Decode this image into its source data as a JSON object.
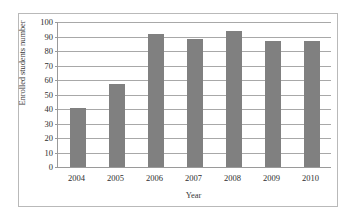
{
  "chart_data": {
    "type": "bar",
    "title": "",
    "subtitle": "",
    "xlabel": "Year",
    "ylabel": "Enrolled students number",
    "categories": [
      "2004",
      "2005",
      "2006",
      "2007",
      "2008",
      "2009",
      "2010"
    ],
    "values": [
      41,
      57,
      92,
      88,
      94,
      87,
      87
    ],
    "series": [
      {
        "name": "Enrolled students number",
        "values": [
          41,
          57,
          92,
          88,
          94,
          87,
          87
        ]
      }
    ],
    "ylim": [
      0,
      100
    ],
    "ytick_step": 10,
    "yticks": [
      100,
      90,
      80,
      70,
      60,
      50,
      40,
      30,
      20,
      10,
      0
    ],
    "ytick_labels": [
      "100",
      "90",
      "80",
      "70",
      "60",
      "50",
      "40",
      "30",
      "20",
      "10",
      "0"
    ],
    "xticks": [
      "2004",
      "2005",
      "2006",
      "2007",
      "2008",
      "2009",
      "2010"
    ],
    "grid": "horizontal",
    "legend": "none",
    "annotations": [],
    "colors": {
      "bar_fill": "#808080",
      "gridline": "#a8a8a8",
      "axis_line": "#9a9a9a",
      "frame_border": "#b9b9b9",
      "tick_text": "#2e2e2e",
      "axis_title_text": "#3a3a3a",
      "plot_background": "#ffffff",
      "figure_background": "#ffffff"
    }
  }
}
